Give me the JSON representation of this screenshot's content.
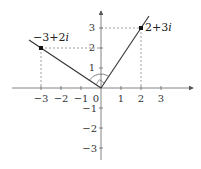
{
  "diagram": {
    "type": "complex-plane",
    "origin_px": [
      101,
      88
    ],
    "unit_px": 20,
    "colors": {
      "axis": "#555555",
      "line": "#333333",
      "dashed": "#666666",
      "point": "#111111"
    },
    "x_ticks": [
      {
        "value": -3,
        "label": "−3"
      },
      {
        "value": -2,
        "label": "−2"
      },
      {
        "value": -1,
        "label": "−1"
      },
      {
        "value": 1,
        "label": "1"
      },
      {
        "value": 2,
        "label": "2"
      },
      {
        "value": 3,
        "label": "3"
      }
    ],
    "y_ticks": [
      {
        "value": 3,
        "label": "3"
      },
      {
        "value": 2,
        "label": "2"
      },
      {
        "value": 1,
        "label": "1"
      },
      {
        "value": -1,
        "label": "−1"
      },
      {
        "value": -2,
        "label": "−2"
      },
      {
        "value": -3,
        "label": "−3"
      }
    ],
    "origin_label": "0",
    "points": [
      {
        "re": 2,
        "im": 3,
        "label_real": "2+3",
        "label_imag": "i"
      },
      {
        "re": -3,
        "im": 2,
        "label_real": "−3+2",
        "label_imag": "i"
      }
    ],
    "angle_marker": "right-angle arc between the two rays at origin"
  }
}
